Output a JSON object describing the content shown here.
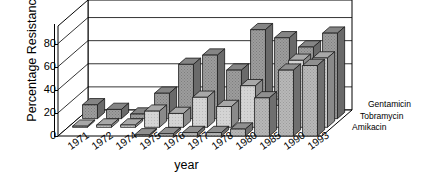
{
  "chart_data": {
    "type": "bar",
    "title": "",
    "xlabel": "year",
    "ylabel": "Percentage Resistance",
    "ylim": [
      0,
      90
    ],
    "yticks": [
      0,
      20,
      40,
      60,
      80
    ],
    "grid": true,
    "legend_position": "right",
    "projection": "3d-grouped-rows",
    "categories": [
      "1971",
      "1972",
      "1974",
      "1975",
      "1976",
      "1977",
      "1978",
      "1980",
      "1985",
      "1990",
      "1993"
    ],
    "series": [
      {
        "name": "Gentamicin",
        "row": "back",
        "color": "#9a9a9a",
        "values": [
          12,
          8,
          4,
          22,
          47,
          55,
          42,
          77,
          70,
          62,
          74
        ]
      },
      {
        "name": "Tobramycin",
        "row": "middle",
        "color": "#cfcfcf",
        "values": [
          1,
          2,
          2,
          14,
          12,
          26,
          18,
          36,
          19,
          58,
          60
        ]
      },
      {
        "name": "Amikacin",
        "row": "front",
        "color": "#b5b5b5",
        "values": [
          0,
          0,
          0,
          1,
          2,
          3,
          3,
          6,
          33,
          57,
          61
        ]
      }
    ]
  },
  "axes": {
    "y_title": "Percentage Resistance",
    "x_title": "year",
    "y_tick_labels": [
      "0",
      "20",
      "40",
      "60",
      "80"
    ],
    "x_tick_labels": [
      "1971",
      "1972",
      "1974",
      "1975",
      "1976",
      "1977",
      "1978",
      "1980",
      "1985",
      "1990",
      "1993"
    ]
  },
  "legend": {
    "items": [
      {
        "label": "Gentamicin"
      },
      {
        "label": "Tobramycin"
      },
      {
        "label": "Amikacin"
      }
    ]
  },
  "colors": {
    "gentamicin": "#9a9a9a",
    "tobramycin": "#cfcfcf",
    "amikacin": "#b5b5b5",
    "axis": "#000000",
    "background": "#ffffff"
  }
}
